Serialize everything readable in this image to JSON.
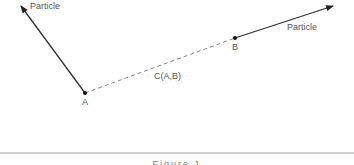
{
  "diagram": {
    "points": {
      "A": {
        "label": "A",
        "x": 85,
        "y": 93
      },
      "B": {
        "label": "B",
        "x": 235,
        "y": 38
      }
    },
    "particles": [
      {
        "label": "Particle",
        "from": "A",
        "tip_x": 20,
        "tip_y": 5
      },
      {
        "label": "Particle",
        "from": "B",
        "tip_x": 332,
        "tip_y": 6
      }
    ],
    "connection": {
      "label": "C(A,B)",
      "style": "dashed"
    },
    "caption": "Figure 1"
  }
}
